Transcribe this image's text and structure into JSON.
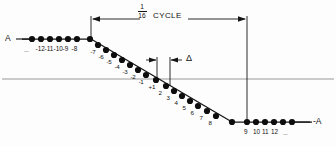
{
  "figure": {
    "amplitude_label_left": "A",
    "amplitude_label_right": "-A",
    "cycle_label": "CYCLE",
    "fraction_numerator": "1",
    "fraction_denominator": "16",
    "delta_label": "Δ",
    "ellipsis_left": "...",
    "ellipsis_right": "..."
  },
  "chart_data": {
    "type": "scatter",
    "xlabel": "",
    "ylabel": "",
    "legend": [],
    "grid": false,
    "upper_plateau_labels": [
      "-12",
      "-11",
      "-10",
      "-9",
      "-8"
    ],
    "ramp_labels_negative": [
      "-7",
      "-6",
      "-5",
      "-4",
      "-3",
      "-2",
      "-1"
    ],
    "ramp_labels_positive": [
      "+1",
      "2",
      "3",
      "4",
      "5",
      "6",
      "7",
      "8"
    ],
    "lower_plateau_labels": [
      "9",
      "10",
      "11",
      "12"
    ],
    "upper_plateau_points": [
      {
        "x": 32,
        "y": 39,
        "label": ""
      },
      {
        "x": 41,
        "y": 39,
        "label": "-12"
      },
      {
        "x": 50,
        "y": 39,
        "label": "-11"
      },
      {
        "x": 59,
        "y": 39,
        "label": "-10"
      },
      {
        "x": 68,
        "y": 39,
        "label": "-9"
      },
      {
        "x": 77,
        "y": 39,
        "label": "-8"
      },
      {
        "x": 90,
        "y": 39,
        "label": ""
      }
    ],
    "ramp_points": [
      {
        "x": 98,
        "y": 45,
        "label": "-7"
      },
      {
        "x": 106,
        "y": 50,
        "label": "-6"
      },
      {
        "x": 114,
        "y": 55,
        "label": "-5"
      },
      {
        "x": 122,
        "y": 60,
        "label": "-4"
      },
      {
        "x": 130,
        "y": 65,
        "label": "-3"
      },
      {
        "x": 138,
        "y": 70,
        "label": "-2"
      },
      {
        "x": 146,
        "y": 75,
        "label": "-1"
      },
      {
        "x": 156,
        "y": 80,
        "label": "+1"
      },
      {
        "x": 166,
        "y": 86,
        "label": "2"
      },
      {
        "x": 174,
        "y": 91,
        "label": "3"
      },
      {
        "x": 182,
        "y": 96,
        "label": "4"
      },
      {
        "x": 190,
        "y": 101,
        "label": "5"
      },
      {
        "x": 198,
        "y": 106,
        "label": "6"
      },
      {
        "x": 207,
        "y": 111,
        "label": "7"
      },
      {
        "x": 216,
        "y": 116,
        "label": "8"
      }
    ],
    "lower_plateau_points": [
      {
        "x": 232,
        "y": 122,
        "label": ""
      },
      {
        "x": 247,
        "y": 122,
        "label": "9"
      },
      {
        "x": 256,
        "y": 122,
        "label": "10"
      },
      {
        "x": 265,
        "y": 122,
        "label": "11"
      },
      {
        "x": 274,
        "y": 122,
        "label": "12"
      },
      {
        "x": 283,
        "y": 122,
        "label": ""
      },
      {
        "x": 292,
        "y": 122,
        "label": ""
      }
    ],
    "axis_line_y": 79,
    "cycle_span_x": [
      91,
      247
    ],
    "delta_span_x": [
      157,
      170
    ],
    "colors": {
      "dot": "#0d0d0d",
      "line": "#1a1a1a",
      "axis": "#8a8a8a"
    }
  }
}
